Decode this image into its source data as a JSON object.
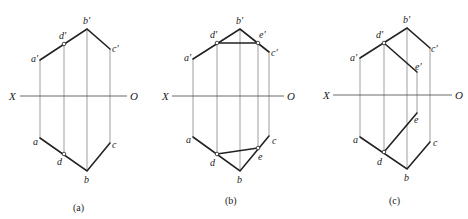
{
  "axis_labels": {
    "left": "X",
    "right": "O"
  },
  "panels": [
    {
      "caption": "(a)",
      "axis": {
        "x1": 20,
        "x2": 127,
        "y": 96,
        "xlabel_x": 10,
        "olabel_x": 130
      },
      "points_top": {
        "a'": [
          40,
          60
        ],
        "d'": [
          64,
          44
        ],
        "b'": [
          87,
          29
        ],
        "c'": [
          110,
          49
        ]
      },
      "points_bottom": {
        "a": [
          40,
          138
        ],
        "d": [
          64,
          154
        ],
        "b": [
          87,
          171
        ],
        "c": [
          110,
          143
        ]
      },
      "labels": {
        "a_top": "a'",
        "d_top": "d'",
        "b_top": "b'",
        "c_top": "c'",
        "a_bot": "a",
        "d_bot": "d",
        "b_bot": "b",
        "c_bot": "c"
      }
    },
    {
      "caption": "(b)",
      "axis": {
        "x1": 172,
        "x2": 284,
        "y": 96,
        "xlabel_x": 163,
        "olabel_x": 288
      },
      "labels": {
        "a_top": "a'",
        "d_top": "d'",
        "b_top": "b'",
        "e_top": "e'",
        "c_top": "c'",
        "a_bot": "a",
        "d_bot": "d",
        "b_bot": "b",
        "e_bot": "e",
        "c_bot": "c"
      }
    },
    {
      "caption": "(c)",
      "axis": {
        "x1": 333,
        "x2": 452,
        "y": 95,
        "xlabel_x": 323,
        "olabel_x": 456
      },
      "labels": {
        "a_top": "a'",
        "d_top": "d'",
        "b_top": "b'",
        "e_top": "e'",
        "c_top": "c'",
        "a_bot": "a",
        "d_bot": "d",
        "b_bot": "b",
        "e_bot": "e",
        "c_bot": "c"
      }
    }
  ]
}
